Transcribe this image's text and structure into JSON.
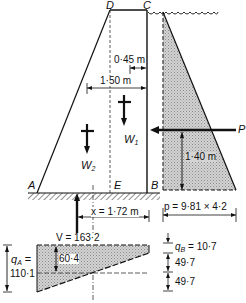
{
  "figure": {
    "type": "gravity dam force diagram",
    "points": {
      "A": "A",
      "B": "B",
      "C": "C",
      "D": "D",
      "E": "E"
    },
    "forces": {
      "w1": "W",
      "w1_sub": "1",
      "w2": "W",
      "w2_sub": "2",
      "p": "P"
    },
    "dimensions": {
      "crest_offset": "0·45 m",
      "w2_offset": "1·50 m",
      "p_height": "1·40 m",
      "x_label": "x = 1·72 m",
      "water_pressure": "p = 9·81  ×  4·2"
    },
    "reaction": {
      "v_label": "V = 163·2"
    },
    "base_pressure": {
      "qa_label_1": "q",
      "qa_sub": "A",
      "qa_eq": "=",
      "qa_value": "110·1",
      "mid_value": "60·4",
      "qb_label": "q",
      "qb_sub": "B",
      "qb_value": "= 10·7",
      "step1": "49·7",
      "step2": "49·7"
    },
    "colors": {
      "ink": "#111111",
      "hatch_fill": "#c8c8c8",
      "background": "#ffffff"
    }
  }
}
